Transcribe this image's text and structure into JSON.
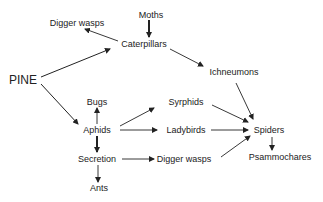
{
  "diagram": {
    "title": "",
    "nodes": [
      {
        "id": "moths",
        "label": "Moths",
        "x": 151,
        "y": 15
      },
      {
        "id": "digger_wasps_top",
        "label": "Digger wasps",
        "x": 77,
        "y": 23
      },
      {
        "id": "caterpillars",
        "label": "Caterpillars",
        "x": 144,
        "y": 44
      },
      {
        "id": "pine",
        "label": "PINE",
        "x": 23,
        "y": 79
      },
      {
        "id": "ichneumons",
        "label": "Ichneumons",
        "x": 234,
        "y": 72
      },
      {
        "id": "bugs",
        "label": "Bugs",
        "x": 97,
        "y": 102
      },
      {
        "id": "syrphids",
        "label": "Syrphids",
        "x": 186,
        "y": 102
      },
      {
        "id": "aphids",
        "label": "Aphids",
        "x": 97,
        "y": 130
      },
      {
        "id": "ladybirds",
        "label": "Ladybirds",
        "x": 186,
        "y": 130
      },
      {
        "id": "spiders",
        "label": "Spiders",
        "x": 268,
        "y": 130
      },
      {
        "id": "secretion",
        "label": "Secretion",
        "x": 97,
        "y": 159
      },
      {
        "id": "digger_wasps_bottom",
        "label": "Digger wasps",
        "x": 180,
        "y": 159
      },
      {
        "id": "psammochares",
        "label": "Psammochares",
        "x": 279,
        "y": 158
      },
      {
        "id": "ants",
        "label": "Ants",
        "x": 99,
        "y": 188
      }
    ],
    "edges": [
      {
        "from": "moths",
        "to": "caterpillars",
        "bold": true
      },
      {
        "from": "caterpillars",
        "to": "digger_wasps_top",
        "bold": false
      },
      {
        "from": "pine",
        "to": "caterpillars",
        "bold": false
      },
      {
        "from": "pine",
        "to": "aphids",
        "bold": false
      },
      {
        "from": "caterpillars",
        "to": "ichneumons",
        "bold": false
      },
      {
        "from": "ichneumons",
        "to": "spiders",
        "bold": false
      },
      {
        "from": "aphids",
        "to": "bugs",
        "bold": false
      },
      {
        "from": "aphids",
        "to": "syrphids",
        "bold": false
      },
      {
        "from": "aphids",
        "to": "ladybirds",
        "bold": false
      },
      {
        "from": "aphids",
        "to": "secretion",
        "bold": true
      },
      {
        "from": "syrphids",
        "to": "spiders",
        "bold": false
      },
      {
        "from": "ladybirds",
        "to": "spiders",
        "bold": false
      },
      {
        "from": "secretion",
        "to": "digger_wasps_bottom",
        "bold": false
      },
      {
        "from": "secretion",
        "to": "ants",
        "bold": false
      },
      {
        "from": "digger_wasps_bottom",
        "to": "spiders",
        "bold": false
      },
      {
        "from": "spiders",
        "to": "psammochares",
        "bold": false
      }
    ]
  }
}
